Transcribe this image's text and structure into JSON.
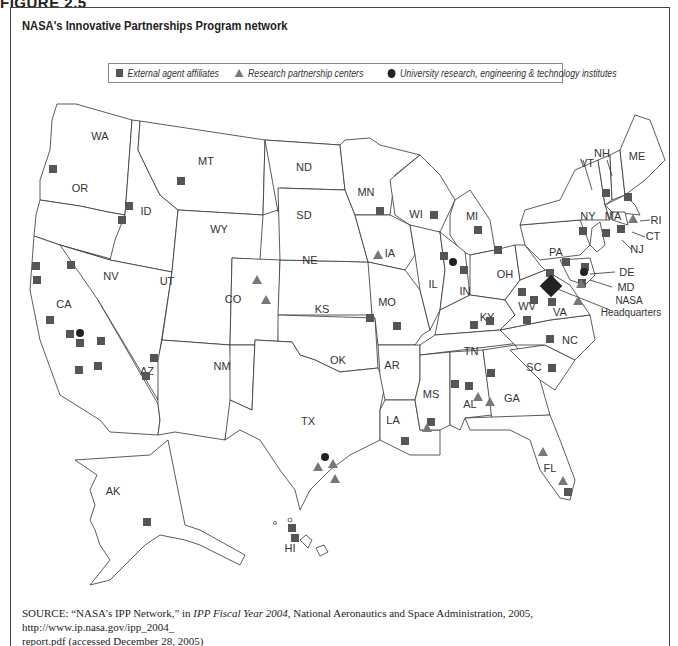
{
  "figure": {
    "label": "FIGURE 2.5",
    "title": "NASA's Innovative Partnerships Program network"
  },
  "legend": {
    "items": [
      {
        "symbol": "square",
        "label": "External agent affiliates",
        "color": "#555555"
      },
      {
        "symbol": "triangle",
        "label": "Research partnership centers",
        "color": "#777777"
      },
      {
        "symbol": "circle",
        "label": "University research, engineering & technology institutes",
        "color": "#222222"
      }
    ]
  },
  "map": {
    "state_labels": [
      "WA",
      "OR",
      "CA",
      "NV",
      "ID",
      "MT",
      "WY",
      "UT",
      "CO",
      "AZ",
      "NM",
      "ND",
      "SD",
      "NE",
      "KS",
      "OK",
      "TX",
      "MN",
      "IA",
      "MO",
      "AR",
      "LA",
      "WI",
      "IL",
      "MI",
      "IN",
      "OH",
      "KY",
      "TN",
      "MS",
      "AL",
      "GA",
      "FL",
      "SC",
      "NC",
      "VA",
      "WV",
      "PA",
      "NY",
      "VT",
      "NH",
      "ME",
      "MA",
      "RI",
      "CT",
      "NJ",
      "DE",
      "MD",
      "AK",
      "HI"
    ],
    "annotations": {
      "hq_line1": "NASA",
      "hq_line2": "Headquarters"
    },
    "markers": {
      "external_agent_affiliates": [
        "OR",
        "ID",
        "ID",
        "MT",
        "CA",
        "CA",
        "CA",
        "CA",
        "CA",
        "CA",
        "CA",
        "CA",
        "NV",
        "AZ",
        "AZ",
        "MN",
        "WI",
        "MI",
        "IL",
        "IN",
        "OH",
        "MO",
        "MO",
        "KY",
        "TN",
        "MS",
        "AL",
        "GA",
        "LA",
        "SC",
        "NC",
        "VA",
        "WV",
        "WV",
        "PA",
        "MD",
        "NY",
        "VT",
        "ME",
        "MA",
        "CT",
        "AK",
        "HI",
        "HI",
        "FL",
        "KS"
      ],
      "research_partnership_centers": [
        "CO",
        "CO",
        "IA",
        "TX",
        "TX",
        "TX",
        "MS",
        "AL",
        "AL",
        "FL",
        "FL",
        "VA",
        "MD",
        "MA"
      ],
      "university_institutes": [
        "CA",
        "IL",
        "TX",
        "MD"
      ],
      "headquarters": "DC"
    }
  },
  "source": {
    "prefix": "SOURCE:",
    "quote": "“NASA’s IPP Network,” in ",
    "publication": "IPP Fiscal Year 2004",
    "rest_line1": ", National Aeronautics and Space Administration, 2005, http://www.ip.nasa.gov/ipp_2004_",
    "line2": "report.pdf (accessed December 28, 2005)"
  }
}
